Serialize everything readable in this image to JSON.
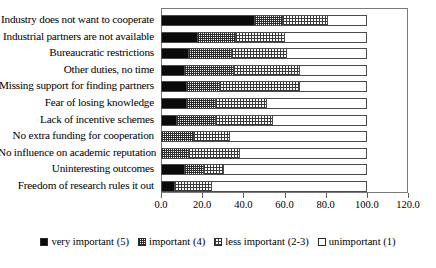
{
  "chart_data": {
    "type": "bar",
    "orientation": "horizontal",
    "stacked": true,
    "title": "",
    "xlabel": "",
    "ylabel": "",
    "xlim": [
      0,
      120
    ],
    "xticks": [
      "0.0",
      "20.0",
      "40.0",
      "60.0",
      "80.0",
      "100.0",
      "120.0"
    ],
    "grid": false,
    "legend_position": "bottom",
    "categories": [
      "Industry does not want to cooperate",
      "Industrial partners are not available",
      "Bureaucratic restrictions",
      "Other duties, no time",
      "Missing support for finding partners",
      "Fear of losing knowledge",
      "Lack of incentive schemes",
      "No extra funding for cooperation",
      "No influence on academic reputation",
      "Uninteresting outcomes",
      "Freedom of research rules it out"
    ],
    "series": [
      {
        "name": "very important (5)",
        "values": [
          45,
          17,
          13,
          11,
          12,
          12,
          7,
          0,
          0,
          11,
          6
        ]
      },
      {
        "name": "important (4)",
        "values": [
          14,
          19,
          21,
          24,
          16,
          14,
          19,
          15,
          13,
          9,
          0
        ]
      },
      {
        "name": "less important (2-3)",
        "values": [
          22,
          24,
          27,
          32,
          39,
          25,
          28,
          18,
          25,
          10,
          18
        ]
      },
      {
        "name": "unimportant (1)",
        "values": [
          19,
          40,
          39,
          33,
          33,
          49,
          46,
          67,
          62,
          70,
          76
        ]
      }
    ]
  },
  "legend": {
    "items": [
      "very important (5)",
      "important (4)",
      "less important (2-3)",
      "unimportant (1)"
    ]
  }
}
